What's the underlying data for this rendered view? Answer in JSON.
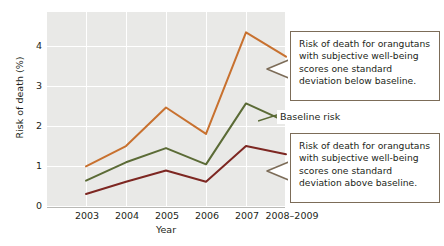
{
  "chart_data": {
    "type": "line",
    "title": "",
    "xlabel": "Year",
    "ylabel": "Risk of death (%)",
    "categories": [
      "2003",
      "2004",
      "2005",
      "2006",
      "2007",
      "2008–2009"
    ],
    "ylim": [
      0,
      4.8
    ],
    "yticks": [
      "0",
      "1",
      "2",
      "3",
      "4"
    ],
    "ytick_values": [
      0,
      1,
      2,
      3,
      4
    ],
    "grid": true,
    "legend_position": "inline-annotation",
    "series": [
      {
        "name": "Risk of death for orangutans with subjective well-being scores one standard deviation below baseline",
        "short_name": "one SD below baseline",
        "color": "#c8712f",
        "values": [
          1.0,
          1.5,
          2.45,
          1.8,
          4.3,
          3.7
        ]
      },
      {
        "name": "Baseline risk",
        "short_name": "Baseline risk",
        "color": "#5b6b36",
        "values": [
          0.65,
          1.1,
          1.45,
          1.05,
          2.55,
          2.1
        ]
      },
      {
        "name": "Risk of death for orangutans with subjective well-being scores one standard deviation above baseline",
        "short_name": "one SD above baseline",
        "color": "#7d2722",
        "values": [
          0.32,
          0.62,
          0.9,
          0.62,
          1.5,
          1.3
        ]
      }
    ],
    "annotations": [
      {
        "id": "callout-below",
        "text": "Risk of death for orangutans with subjective well-being scores one standard deviation below baseline.",
        "points_to_series": "one SD below baseline"
      },
      {
        "id": "callout-above",
        "text": "Risk of death for orangutans with subjective well-being scores one standard deviation above baseline.",
        "points_to_series": "one SD above baseline"
      },
      {
        "id": "baseline-label",
        "text": "Baseline risk",
        "points_to_series": "Baseline risk"
      }
    ]
  },
  "axes": {
    "ylabel": "Risk of death (%)",
    "xlabel": "Year",
    "yticks": [
      "0",
      "1",
      "2",
      "3",
      "4"
    ],
    "xticks": [
      "2003",
      "2004",
      "2005",
      "2006",
      "2007",
      "2008–2009"
    ]
  },
  "labels": {
    "baseline_risk": "Baseline risk",
    "callout_below": "Risk of death for orangutans with subjective well-being scores one standard deviation below baseline.",
    "callout_above": "Risk of death for orangutans with subjective well-being scores one standard deviation above baseline."
  },
  "colors": {
    "series_below": "#c8712f",
    "series_baseline": "#5b6b36",
    "series_above": "#7d2722",
    "plot_background": "#e9e9e7",
    "gridline": "#ffffff",
    "callout_border": "#7c6c58",
    "text": "#231f20"
  }
}
